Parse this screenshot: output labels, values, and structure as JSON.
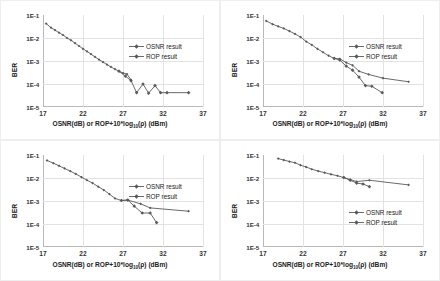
{
  "figure": {
    "background": "#fbfbfb",
    "series_color": "#595959",
    "grid_color": "#e2e2e2",
    "axis_color": "#b9b9b9"
  },
  "common": {
    "ylabel": "BER",
    "xlabel_pre": "OSNR(dB) or ROP+10*log",
    "xlabel_sub": "10",
    "xlabel_post": "(ρ) (dBm)",
    "yticks": [
      "1E-1",
      "1E-2",
      "1E-3",
      "1E-4",
      "1E-5"
    ],
    "xticks": [
      "17",
      "22",
      "27",
      "32",
      "37"
    ],
    "legend": [
      {
        "label": "OSNR result",
        "marker": "diamond"
      },
      {
        "label": "ROP result",
        "marker": "diamond"
      }
    ]
  },
  "chart_data": [
    {
      "type": "line",
      "panel": "a",
      "title": "(a) Baud rate 45G",
      "xlabel": "OSNR(dB) or ROP+10*log10(ρ) (dBm)",
      "ylabel": "BER",
      "xlim": [
        17,
        37
      ],
      "ylim": [
        1e-05,
        0.1
      ],
      "yscale": "log",
      "grid": true,
      "legend_position": "upper-right-inside",
      "series": [
        {
          "name": "OSNR result",
          "x": [
            17.4,
            18.0,
            18.5,
            19.0,
            19.5,
            20.0,
            20.5,
            21.0,
            21.5,
            22.0,
            22.5,
            23.0,
            23.5,
            24.0,
            24.5,
            25.0,
            25.5,
            26.0,
            26.5,
            27.0,
            27.5,
            28.0
          ],
          "y": [
            0.042,
            0.028,
            0.022,
            0.017,
            0.0135,
            0.01,
            0.008,
            0.006,
            0.0045,
            0.0034,
            0.0026,
            0.002,
            0.0015,
            0.00115,
            0.0009,
            0.0007,
            0.00055,
            0.00044,
            0.00036,
            0.0003,
            0.00027,
            0.00015
          ]
        },
        {
          "name": "ROP result",
          "x": [
            26.5,
            27.3,
            28.0,
            28.7,
            29.5,
            30.2,
            31.0,
            31.7,
            32.5,
            35.2
          ],
          "y": [
            0.00036,
            0.00022,
            0.00014,
            4.2e-05,
            0.0001,
            4e-05,
            8.5e-05,
            4.2e-05,
            4.2e-05,
            4.2e-05
          ]
        }
      ]
    },
    {
      "type": "line",
      "panel": "b",
      "title": "(b) Baud rate 56G",
      "xlabel": "OSNR(dB) or ROP+10*log10(ρ) (dBm)",
      "ylabel": "BER",
      "xlim": [
        17,
        37
      ],
      "ylim": [
        1e-05,
        0.1
      ],
      "yscale": "log",
      "grid": true,
      "legend_position": "upper-right-inside",
      "series": [
        {
          "name": "OSNR result",
          "x": [
            17.4,
            18.2,
            18.9,
            19.6,
            20.3,
            21.0,
            21.7,
            22.4,
            23.1,
            23.8,
            24.5,
            25.2,
            25.9,
            26.6,
            27.4,
            28.2,
            29.0,
            30.2,
            32.0,
            35.2
          ],
          "y": [
            0.055,
            0.04,
            0.032,
            0.026,
            0.02,
            0.015,
            0.011,
            0.007,
            0.005,
            0.0034,
            0.0024,
            0.0017,
            0.0013,
            0.00125,
            0.00085,
            0.00065,
            0.00036,
            0.00026,
            0.00018,
            0.000125
          ]
        },
        {
          "name": "ROP result",
          "x": [
            25.9,
            26.6,
            27.4,
            28.2,
            29.0,
            29.8,
            30.6,
            31.9
          ],
          "y": [
            0.0013,
            0.0011,
            0.0006,
            0.0004,
            0.0002,
            8.5e-05,
            8e-05,
            4.2e-05
          ]
        }
      ]
    },
    {
      "type": "line",
      "panel": "c",
      "title": "(c) Baud rate 64G",
      "xlabel": "OSNR(dB) or ROP+10*log10(ρ) (dBm)",
      "ylabel": "BER",
      "xlim": [
        17,
        37
      ],
      "ylim": [
        1e-05,
        0.1
      ],
      "yscale": "log",
      "grid": true,
      "legend_position": "upper-right-inside",
      "series": [
        {
          "name": "OSNR result",
          "x": [
            17.5,
            18.3,
            19.0,
            19.7,
            20.4,
            21.1,
            21.8,
            22.5,
            23.2,
            23.9,
            24.6,
            25.3,
            26.0,
            26.8,
            27.6,
            29.2,
            30.4,
            35.2
          ],
          "y": [
            0.058,
            0.044,
            0.034,
            0.026,
            0.02,
            0.015,
            0.011,
            0.008,
            0.006,
            0.0042,
            0.003,
            0.002,
            0.0013,
            0.00105,
            0.0011,
            0.00075,
            0.0005,
            0.00036
          ]
        },
        {
          "name": "ROP result",
          "x": [
            26.8,
            27.6,
            28.4,
            29.4,
            30.4,
            31.2
          ],
          "y": [
            0.00105,
            0.0011,
            0.0006,
            0.0003,
            0.0003,
            0.000115
          ]
        }
      ]
    },
    {
      "type": "line",
      "panel": "d",
      "title": "(d) Baud rate 86G",
      "xlabel": "OSNR(dB) or ROP+10*log10(ρ) (dBm)",
      "ylabel": "BER",
      "xlim": [
        17,
        37
      ],
      "ylim": [
        1e-05,
        0.1
      ],
      "yscale": "log",
      "grid": true,
      "legend_position": "lower-right-inside",
      "series": [
        {
          "name": "OSNR result",
          "x": [
            18.9,
            19.6,
            20.3,
            21.0,
            21.7,
            22.4,
            23.1,
            23.9,
            24.7,
            25.5,
            26.3,
            27.1,
            27.9,
            28.7,
            30.3,
            35.2
          ],
          "y": [
            0.07,
            0.06,
            0.052,
            0.046,
            0.036,
            0.03,
            0.024,
            0.02,
            0.017,
            0.0145,
            0.0125,
            0.0105,
            0.0085,
            0.007,
            0.008,
            0.005
          ]
        },
        {
          "name": "ROP result",
          "x": [
            27.1,
            27.9,
            28.7,
            29.5,
            30.3
          ],
          "y": [
            0.0105,
            0.008,
            0.006,
            0.0055,
            0.0042
          ]
        }
      ]
    }
  ]
}
